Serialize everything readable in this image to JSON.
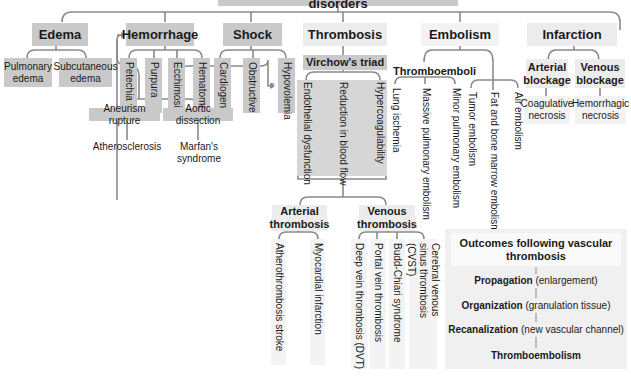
{
  "title": "Pathophysiology of hemodynamic disorders",
  "colors": {
    "line": "#8a8a8a",
    "box_dark": "#c9c9c9",
    "box_light": "#ececec",
    "virchow_panel": "#d6d6d6"
  },
  "categories": {
    "edema": {
      "label": "Edema",
      "children": [
        "Pulmonary edema",
        "Subcutaneous edema"
      ]
    },
    "hemorrhage": {
      "label": "Hemorrhage",
      "children": [
        "Petechia",
        "Purpura",
        "Ecchimosis",
        "Hematoma"
      ]
    },
    "shock": {
      "label": "Shock",
      "children": [
        "Cardiogenic",
        "Obstructive",
        "Hypovolemia"
      ]
    },
    "thrombosis": {
      "label": "Thrombosis",
      "virchow": {
        "label": "Virchow's triad",
        "children": [
          "Endothelial dysfunction",
          "Reduction in blood flow",
          "Hypercoagulability"
        ]
      },
      "arterial": {
        "label": "Arterial thrombosis",
        "children": [
          "Atherothrombosis stroke",
          "Myocardial infarction"
        ]
      },
      "venous": {
        "label": "Venous thrombosis",
        "children": [
          "Deep vein thrombosis (DVT)",
          "Portal vein thrombosis",
          "Budd-Chiari syndrome",
          "Cerebral venous sinus thrombosis (CVST)"
        ]
      }
    },
    "embolism": {
      "label": "Embolism",
      "thromboemboli": {
        "label": "Thromboemboli",
        "children": [
          "Lung ischemia",
          "Massive pulmonary embolism",
          "Minor pulmonary embolism"
        ]
      },
      "others": [
        "Tumor embolism",
        "Fat and bone marrow embolism",
        "Air embolism"
      ]
    },
    "infarction": {
      "label": "Infarction",
      "arterial": {
        "label": "Arterial blockage",
        "result": "Coagulative necrosis"
      },
      "venous": {
        "label": "Venous blockage",
        "result": "Hemorrhagic necrosis"
      }
    }
  },
  "vascular_causes": {
    "aneurysm": {
      "label": "Aneurism rupture",
      "cause": "Atherosclerosis"
    },
    "dissection": {
      "label": "Aortic dissection",
      "cause": "Marfan's syndrome"
    }
  },
  "outcomes": {
    "title": "Outcomes following vascular thrombosis",
    "steps": [
      {
        "bold": "Propagation",
        "detail": "(enlargement)"
      },
      {
        "bold": "Organization",
        "detail": "(granulation tissue)"
      },
      {
        "bold": "Recanalization",
        "detail": "(new vascular channel)"
      },
      {
        "bold": "Thromboembolism",
        "detail": ""
      }
    ]
  }
}
